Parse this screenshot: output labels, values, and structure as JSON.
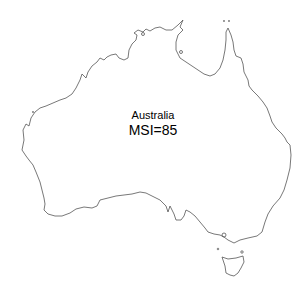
{
  "map": {
    "region": "Australia",
    "label": "Australia",
    "metric_label": "MSI=85",
    "metric_name": "MSI",
    "metric_value": 85,
    "outline_color": "#555555",
    "background": "#ffffff"
  }
}
